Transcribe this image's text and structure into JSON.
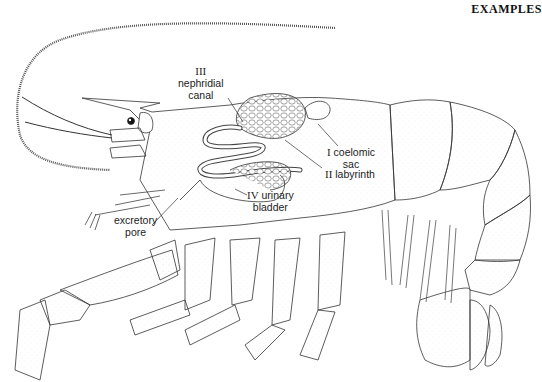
{
  "header": {
    "running_title": "EXAMPLES"
  },
  "figure": {
    "labels": [
      {
        "numeral": "I",
        "text_line1": "coelomic",
        "text_line2": "sac"
      },
      {
        "numeral": "II",
        "text_line1": "labyrinth",
        "text_line2": ""
      },
      {
        "numeral": "III",
        "text_line1": "nephridial",
        "text_line2": "canal"
      },
      {
        "numeral": "IV",
        "text_line1": "urinary",
        "text_line2": "bladder"
      },
      {
        "numeral": "",
        "text_line1": "excretory",
        "text_line2": "pore"
      }
    ]
  }
}
